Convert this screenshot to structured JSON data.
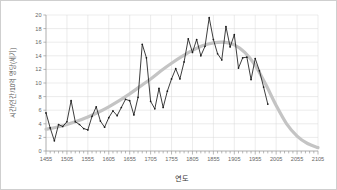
{
  "chart_data": {
    "type": "line",
    "title": "",
    "xlabel": "연도",
    "ylabel": "시간/인간/10억 명당(세기)",
    "xlim": [
      1455,
      2105
    ],
    "ylim": [
      0,
      20
    ],
    "xticks": [
      1455,
      1505,
      1555,
      1605,
      1655,
      1705,
      1755,
      1805,
      1855,
      1905,
      1955,
      2005,
      2055,
      2105
    ],
    "xtick_labels": [
      "1455",
      "1505",
      "1555",
      "1605",
      "1655",
      "1705",
      "1755",
      "1805",
      "1855",
      "1905",
      "1955",
      "2005",
      "2055",
      "2105"
    ],
    "yticks": [
      0,
      2,
      4,
      6,
      8,
      10,
      12,
      14,
      16,
      18,
      20
    ],
    "ytick_labels": [
      "0",
      "2",
      "4",
      "6",
      "8",
      "10",
      "12",
      "14",
      "16",
      "18",
      "20"
    ],
    "x_minor_tick_step": 10,
    "grid": true,
    "legend": "none",
    "series": [
      {
        "name": "관측값",
        "kind": "line",
        "color": "#1a1a1a",
        "x": [
          1455,
          1465,
          1475,
          1485,
          1495,
          1505,
          1515,
          1525,
          1535,
          1545,
          1555,
          1565,
          1575,
          1585,
          1595,
          1605,
          1615,
          1625,
          1635,
          1645,
          1655,
          1665,
          1675,
          1685,
          1695,
          1705,
          1715,
          1725,
          1735,
          1745,
          1755,
          1765,
          1775,
          1785,
          1795,
          1805,
          1815,
          1825,
          1835,
          1845,
          1855,
          1865,
          1875,
          1885,
          1895,
          1905,
          1915,
          1925,
          1935,
          1945,
          1955,
          1965,
          1975,
          1985
        ],
        "values": [
          5.6,
          3.4,
          1.5,
          3.9,
          3.6,
          4.3,
          7.4,
          4.3,
          3.9,
          3.3,
          3.1,
          5.1,
          6.5,
          4.4,
          3.5,
          4.9,
          5.9,
          5.2,
          6.4,
          7.6,
          7.4,
          5.3,
          7.9,
          15.7,
          13.7,
          7.3,
          6.2,
          9.2,
          6.4,
          8.8,
          10.6,
          12.1,
          10.6,
          13.1,
          16.5,
          14.5,
          16.4,
          14.0,
          15.4,
          19.6,
          16.4,
          14.3,
          13.4,
          18.3,
          15.3,
          17.1,
          12.2,
          13.7,
          13.8,
          10.5,
          13.6,
          11.8,
          9.4,
          6.9
        ]
      },
      {
        "name": "추세선",
        "kind": "smooth-trend",
        "color": "#c4c4c4",
        "x": [
          1455,
          1480,
          1505,
          1530,
          1555,
          1580,
          1605,
          1630,
          1655,
          1680,
          1705,
          1730,
          1755,
          1780,
          1805,
          1830,
          1855,
          1880,
          1905,
          1930,
          1955,
          1980,
          2005,
          2030,
          2055,
          2080,
          2105
        ],
        "values": [
          3.2,
          3.5,
          3.9,
          4.4,
          5.0,
          5.7,
          6.5,
          7.4,
          8.4,
          9.5,
          10.6,
          11.8,
          12.9,
          13.9,
          14.8,
          15.5,
          15.9,
          16.0,
          15.6,
          14.5,
          12.6,
          9.8,
          6.7,
          4.0,
          2.2,
          1.1,
          0.5
        ]
      }
    ]
  },
  "plot": {
    "background": "#ffffff",
    "grid_color": "#d8d8d8",
    "axis_color": "#999999",
    "border_color": "#cfcfcf"
  }
}
